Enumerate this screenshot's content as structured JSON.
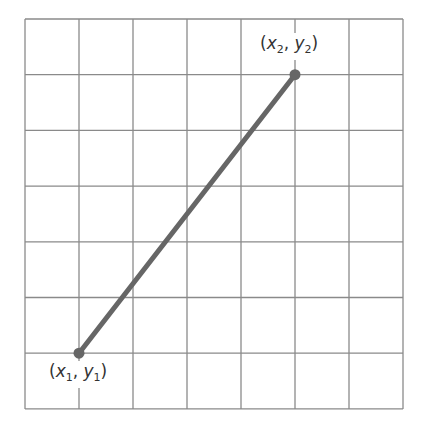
{
  "diagram": {
    "type": "coordinate-grid-line-segment",
    "grid": {
      "columns": 7,
      "rows": 7,
      "left": 25,
      "top": 19,
      "cell_w": 54.0,
      "cell_h": 55.7,
      "line_color": "#8a8a8a"
    },
    "segment": {
      "color": "#666666",
      "width": 5
    },
    "points": [
      {
        "id": "p1",
        "grid_x": 1,
        "grid_y": 1,
        "label_x": "x",
        "label_y": "y",
        "sub": "1"
      },
      {
        "id": "p2",
        "grid_x": 5,
        "grid_y": 6,
        "label_x": "x",
        "label_y": "y",
        "sub": "2"
      }
    ]
  },
  "labels": {
    "p1": {
      "open": "(",
      "x": "x",
      "sub_x": "1",
      "sep": ", ",
      "y": "y",
      "sub_y": "1",
      "close": ")"
    },
    "p2": {
      "open": "(",
      "x": "x",
      "sub_x": "2",
      "sep": ", ",
      "y": "y",
      "sub_y": "2",
      "close": ")"
    }
  }
}
